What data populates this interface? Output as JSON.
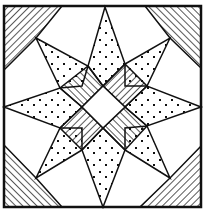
{
  "colors": {
    "ink": "#111111",
    "background": "#ffffff"
  },
  "parts": {
    "corners": {
      "fill": "diagonal-stripes",
      "count": 4
    },
    "star_points": {
      "fill": "cross-dots",
      "count": 8
    },
    "inner_ring": {
      "fill": "parallel-stripes",
      "count": 4
    },
    "center": {
      "fill": "blank"
    }
  }
}
